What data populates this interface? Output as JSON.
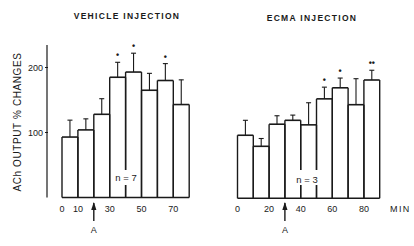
{
  "figure": {
    "ylabel": "ACh OUTPUT % CHANGES",
    "xunit_label": "MIN",
    "arrow_label": "A"
  },
  "chart_data": [
    {
      "type": "bar",
      "title": "VEHICLE INJECTION",
      "xlabel": "MIN",
      "ylabel": "ACh OUTPUT % CHANGES",
      "x": [
        0,
        10,
        20,
        30,
        40,
        50,
        60,
        70
      ],
      "x_tick_labels": [
        "0",
        "10",
        "30",
        "50",
        "70"
      ],
      "x_tick_values": [
        0,
        10,
        30,
        50,
        70
      ],
      "y_tick_labels": [
        "100",
        "200"
      ],
      "y_tick_values": [
        100,
        200
      ],
      "values": [
        93,
        104,
        128,
        185,
        193,
        165,
        180,
        143
      ],
      "error_upper": [
        119,
        121,
        152,
        208,
        222,
        191,
        206,
        181
      ],
      "significance": [
        "",
        "",
        "",
        "*",
        "*",
        "",
        "*",
        ""
      ],
      "n_label": "n = 7",
      "arrow_at": 20,
      "arrow_label": "A",
      "ylim": [
        0,
        245
      ],
      "grid": false
    },
    {
      "type": "bar",
      "title": "ECMA INJECTION",
      "xlabel": "MIN",
      "ylabel": "ACh OUTPUT % CHANGES",
      "x": [
        0,
        10,
        20,
        30,
        40,
        50,
        60,
        70,
        80
      ],
      "x_tick_labels": [
        "0",
        "20",
        "40",
        "60",
        "80"
      ],
      "x_tick_values": [
        0,
        20,
        40,
        60,
        80
      ],
      "values": [
        97,
        80,
        114,
        120,
        113,
        153,
        170,
        144,
        182
      ],
      "error_upper": [
        120,
        92,
        127,
        128,
        147,
        171,
        185,
        184,
        197
      ],
      "significance": [
        "",
        "",
        "",
        "",
        "",
        "*",
        "*",
        "",
        "**"
      ],
      "n_label": "n = 3",
      "arrow_at": 30,
      "arrow_label": "A",
      "ylim": [
        0,
        245
      ],
      "grid": false
    }
  ]
}
